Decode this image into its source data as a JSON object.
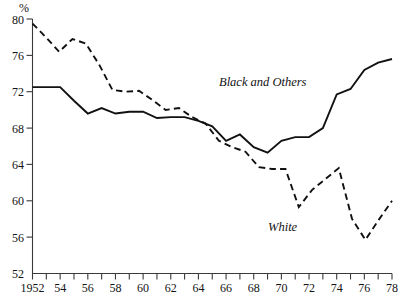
{
  "chart_data": {
    "type": "line",
    "title": "",
    "subtitle": "",
    "xlabel": "",
    "ylabel": "%",
    "unit": "%",
    "xlim": [
      1952,
      1978
    ],
    "ylim": [
      52,
      80
    ],
    "ytick_step": 4,
    "xtick_step": 1,
    "xtick_label_step": 2,
    "grid": false,
    "legend_position": "inline-annotations",
    "yticks": [
      52,
      56,
      60,
      64,
      68,
      72,
      76,
      80
    ],
    "ytick_labels": [
      "52",
      "56",
      "60",
      "64",
      "68",
      "72",
      "76",
      "80"
    ],
    "xticks": [
      1952,
      1953,
      1954,
      1955,
      1956,
      1957,
      1958,
      1959,
      1960,
      1961,
      1962,
      1963,
      1964,
      1965,
      1966,
      1967,
      1968,
      1969,
      1970,
      1971,
      1972,
      1973,
      1974,
      1975,
      1976,
      1977,
      1978
    ],
    "xtick_labels": [
      "1952",
      "54",
      "56",
      "58",
      "60",
      "62",
      "64",
      "66",
      "68",
      "70",
      "72",
      "74",
      "76",
      "78"
    ],
    "xtick_label_years": [
      1952,
      1954,
      1956,
      1958,
      1960,
      1962,
      1964,
      1966,
      1968,
      1970,
      1972,
      1974,
      1976,
      1978
    ],
    "x": [
      1952,
      1953,
      1954,
      1955,
      1956,
      1957,
      1958,
      1959,
      1960,
      1961,
      1962,
      1963,
      1964,
      1965,
      1966,
      1967,
      1968,
      1969,
      1970,
      1971,
      1972,
      1973,
      1974,
      1975,
      1976,
      1977,
      1978
    ],
    "series": [
      {
        "name": "Black and Others",
        "style": "solid",
        "color": "#111111",
        "label_x": 1969,
        "label_y": 74.6,
        "values": [
          72.5,
          72.5,
          72.5,
          71.0,
          69.6,
          70.2,
          69.6,
          69.8,
          69.8,
          69.1,
          69.2,
          69.2,
          68.8,
          68.2,
          66.6,
          67.3,
          65.9,
          65.3,
          66.6,
          67.0,
          67.0,
          68.0,
          71.7,
          72.3,
          74.4,
          75.2,
          75.6
        ]
      },
      {
        "name": "White",
        "style": "dashed",
        "color": "#111111",
        "label_x": 1972,
        "label_y": 58.2,
        "values": [
          79.5,
          78.0,
          76.4,
          77.8,
          77.3,
          75.0,
          72.2,
          72.0,
          72.1,
          71.1,
          70.0,
          70.2,
          69.2,
          68.5,
          66.6,
          65.6,
          65.3,
          64.0,
          63.6,
          63.5,
          63.4,
          63.6,
          62.2,
          59.3,
          61.0,
          62.2,
          63.4
        ]
      }
    ],
    "note": "White series follows the upper path 1952-1965 and the lower path thereafter; dashed line reaches a minimum of about 55.7 in 1975 and recovers to about 60.0 in 1978.",
    "series_white_full": [
      79.5,
      78.0,
      76.4,
      77.8,
      77.3,
      75.0,
      72.2,
      72.0,
      72.1,
      71.1,
      70.0,
      70.2,
      69.2,
      68.5,
      66.6,
      65.9,
      65.4,
      63.7,
      63.5,
      63.5,
      59.3,
      61.2,
      62.4,
      63.6,
      58.0,
      55.7,
      57.9,
      60.0
    ]
  }
}
